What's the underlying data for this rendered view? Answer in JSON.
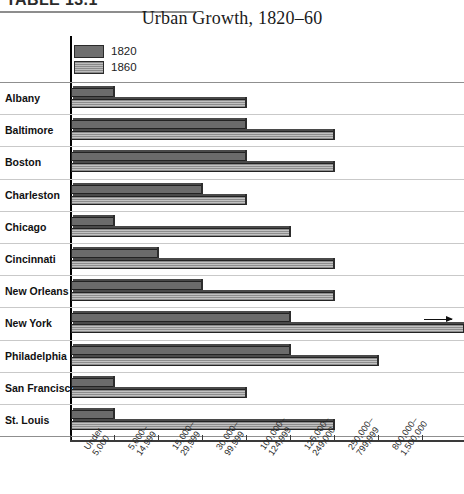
{
  "table_label": "TABLE 13.1",
  "chart_data": {
    "type": "bar",
    "orientation": "horizontal",
    "title": "Urban Growth, 1820–60",
    "xlabel": "",
    "ylabel": "",
    "grid": true,
    "legend_position": "top-left",
    "categories": [
      "Albany",
      "Baltimore",
      "Boston",
      "Charleston",
      "Chicago",
      "Cincinnati",
      "New Orleans",
      "New York",
      "Philadelphia",
      "San Francisco",
      "St. Louis"
    ],
    "x_tick_labels": [
      "Under\n5,000",
      "5,000–\n14,999",
      "15,000–\n29,999",
      "30,000–\n99,999",
      "100,000–\n124,999",
      "125,000–\n249,000",
      "250,000–\n799,999",
      "800,000–\n1,500,000"
    ],
    "x_tick_labels_flat": [
      "Under 5,000",
      "5,000–14,999",
      "15,000–29,999",
      "30,000–99,999",
      "100,000–124,999",
      "125,000–249,000",
      "250,000–799,999",
      "800,000–1,500,000"
    ],
    "series": [
      {
        "name": "1820",
        "color": "#6b6b6b",
        "values": [
          1.0,
          4.0,
          4.0,
          3.0,
          1.0,
          2.0,
          3.0,
          5.0,
          5.0,
          1.0,
          1.0
        ],
        "value_labels": [
          "Under 5,000",
          "30,000–99,999",
          "30,000–99,999",
          "15,000–29,999",
          "Under 5,000",
          "5,000–14,999",
          "15,000–29,999",
          "100,000–124,999",
          "100,000–124,999",
          "Under 5,000",
          "Under 5,000"
        ]
      },
      {
        "name": "1860",
        "color": "#a8a8a8",
        "values": [
          4.0,
          6.0,
          6.0,
          4.0,
          5.0,
          6.0,
          6.0,
          9.0,
          7.0,
          4.0,
          6.0
        ],
        "value_labels": [
          "30,000–99,999",
          "125,000–249,000",
          "125,000–249,000",
          "30,000–99,999",
          "100,000–124,999",
          "125,000–249,000",
          "125,000–249,000",
          "800,000–1,500,000",
          "250,000–799,999",
          "30,000–99,999",
          "125,000–249,000"
        ],
        "overflow_index": 7,
        "overflow_note": "bar extends beyond plot with arrow"
      }
    ]
  }
}
